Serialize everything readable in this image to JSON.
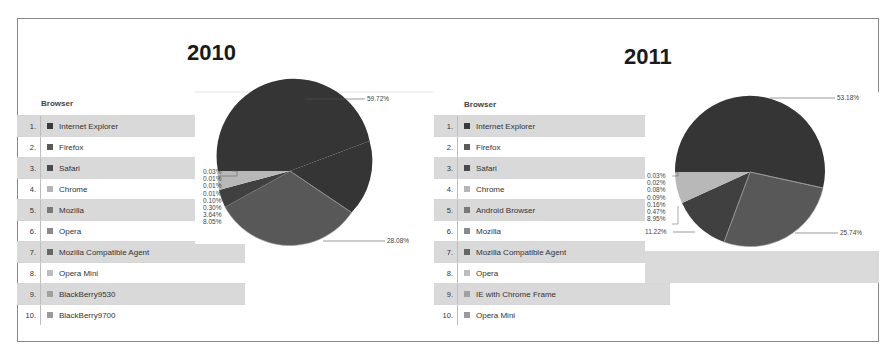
{
  "panels": [
    {
      "title": "2010",
      "table": {
        "header": "Browser",
        "rows": [
          {
            "rank": "1.",
            "name": "Internet Explorer",
            "swatch": "#3a3a3a"
          },
          {
            "rank": "2.",
            "name": "Firefox",
            "swatch": "#5a5a5a"
          },
          {
            "rank": "3.",
            "name": "Safari",
            "swatch": "#4a4a4a"
          },
          {
            "rank": "4.",
            "name": "Chrome",
            "swatch": "#b5b5b5"
          },
          {
            "rank": "5.",
            "name": "Mozilla",
            "swatch": "#7a7a7a"
          },
          {
            "rank": "6.",
            "name": "Opera",
            "swatch": "#8a8a8a"
          },
          {
            "rank": "7.",
            "name": "Mozilla Compatible Agent",
            "swatch": "#666666"
          },
          {
            "rank": "8.",
            "name": "Opera Mini",
            "swatch": "#bdbdbd"
          },
          {
            "rank": "9.",
            "name": "BlackBerry9530",
            "swatch": "#a0a0a0"
          },
          {
            "rank": "10.",
            "name": "BlackBerry9700",
            "swatch": "#9a9a9a"
          }
        ]
      },
      "pie_labels": {
        "large_top": "59.72%",
        "large_bottom": "28.08%",
        "small": [
          "0.03%",
          "0.01%",
          "0.01%",
          "0.01%",
          "0.10%",
          "0.30%",
          "3.64%",
          "8.05%"
        ]
      }
    },
    {
      "title": "2011",
      "table": {
        "header": "Browser",
        "rows": [
          {
            "rank": "1.",
            "name": "Internet Explorer",
            "swatch": "#3a3a3a"
          },
          {
            "rank": "2.",
            "name": "Firefox",
            "swatch": "#5a5a5a"
          },
          {
            "rank": "3.",
            "name": "Safari",
            "swatch": "#4a4a4a"
          },
          {
            "rank": "4.",
            "name": "Chrome",
            "swatch": "#b5b5b5"
          },
          {
            "rank": "5.",
            "name": "Android Browser",
            "swatch": "#7a7a7a"
          },
          {
            "rank": "6.",
            "name": "Mozilla",
            "swatch": "#8a8a8a"
          },
          {
            "rank": "7.",
            "name": "Mozilla Compatible Agent",
            "swatch": "#666666"
          },
          {
            "rank": "8.",
            "name": "Opera",
            "swatch": "#bdbdbd"
          },
          {
            "rank": "9.",
            "name": "IE with Chrome Frame",
            "swatch": "#a0a0a0"
          },
          {
            "rank": "10.",
            "name": "Opera Mini",
            "swatch": "#9a9a9a"
          }
        ]
      },
      "pie_labels": {
        "large_top": "53.18%",
        "large_bottom": "25.74%",
        "left": "11.22%",
        "small": [
          "0.03%",
          "0.02%",
          "0.08%",
          "0.09%",
          "0.16%",
          "0.47%",
          "8.95%"
        ]
      }
    }
  ],
  "chart_data": [
    {
      "type": "pie",
      "title": "2010",
      "legend_title": "Browser",
      "legend_position": "left",
      "categories": [
        "Internet Explorer",
        "Firefox",
        "Safari",
        "Chrome",
        "Mozilla",
        "Opera",
        "Mozilla Compatible Agent",
        "Opera Mini",
        "BlackBerry9530",
        "BlackBerry9700"
      ],
      "slice_labels": [
        "59.72%",
        "28.08%",
        "8.05%",
        "3.64%",
        "0.30%",
        "0.10%",
        "0.01%",
        "0.01%",
        "0.01%",
        "0.03%"
      ],
      "values": [
        59.72,
        28.08,
        8.05,
        3.64,
        0.3,
        0.1,
        0.01,
        0.01,
        0.01,
        0.03
      ]
    },
    {
      "type": "pie",
      "title": "2011",
      "legend_title": "Browser",
      "legend_position": "left",
      "categories": [
        "Internet Explorer",
        "Firefox",
        "Safari",
        "Chrome",
        "Android Browser",
        "Mozilla",
        "Mozilla Compatible Agent",
        "Opera",
        "IE with Chrome Frame",
        "Opera Mini"
      ],
      "slice_labels": [
        "53.18%",
        "25.74%",
        "11.22%",
        "8.95%",
        "0.47%",
        "0.16%",
        "0.09%",
        "0.08%",
        "0.02%",
        "0.03%"
      ],
      "values": [
        53.18,
        25.74,
        11.22,
        8.95,
        0.47,
        0.16,
        0.09,
        0.08,
        0.02,
        0.03
      ]
    }
  ]
}
